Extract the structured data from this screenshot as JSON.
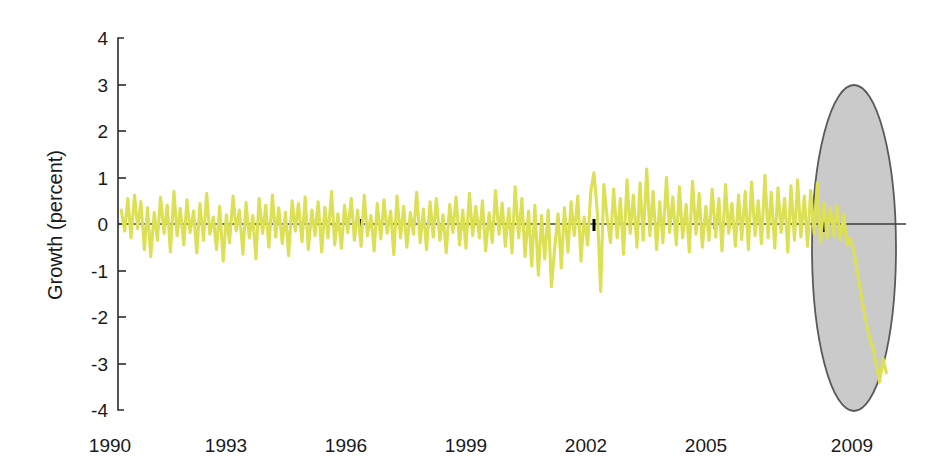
{
  "chart_data": {
    "type": "line",
    "title": "",
    "subtitle": "",
    "xlabel": "",
    "ylabel": "Growth (percent)",
    "xlim": [
      1990.0,
      2010.0
    ],
    "ylim": [
      -4,
      4
    ],
    "grid": false,
    "legend": null,
    "series_color": "#dce055",
    "x_tick_labels": [
      "1990",
      "1993",
      "1996",
      "1999",
      "2002",
      "2005",
      "2009"
    ],
    "x_tick_values": [
      1990,
      1993,
      1996,
      1999,
      2002,
      2005,
      2009
    ],
    "y_tick_labels": [
      "4",
      "3",
      "2",
      "1",
      "0",
      "-1",
      "-2",
      "-3",
      "-4"
    ],
    "y_tick_values": [
      4,
      3,
      2,
      1,
      0,
      -1,
      -2,
      -3,
      -4
    ],
    "annotations": [
      {
        "name": "recession-highlight-ellipse",
        "shape": "ellipse",
        "fill": "#c6c6c6",
        "stroke": "#5a5a5a",
        "center_x": 2008.9,
        "center_y": -0.5,
        "radius_x_years": 1.0,
        "radius_y_percent": 3.5
      }
    ],
    "series": [
      {
        "name": "Growth",
        "color": "#dce055",
        "x": [
          1990.08,
          1990.17,
          1990.25,
          1990.33,
          1990.42,
          1990.5,
          1990.58,
          1990.67,
          1990.75,
          1990.83,
          1990.92,
          1991.0,
          1991.08,
          1991.17,
          1991.25,
          1991.33,
          1991.42,
          1991.5,
          1991.58,
          1991.67,
          1991.75,
          1991.83,
          1991.92,
          1992.0,
          1992.08,
          1992.17,
          1992.25,
          1992.33,
          1992.42,
          1992.5,
          1992.58,
          1992.67,
          1992.75,
          1992.83,
          1992.92,
          1993.0,
          1993.08,
          1993.17,
          1993.25,
          1993.33,
          1993.42,
          1993.5,
          1993.58,
          1993.67,
          1993.75,
          1993.83,
          1993.92,
          1994.0,
          1994.08,
          1994.17,
          1994.25,
          1994.33,
          1994.42,
          1994.5,
          1994.58,
          1994.67,
          1994.75,
          1994.83,
          1994.92,
          1995.0,
          1995.08,
          1995.17,
          1995.25,
          1995.33,
          1995.42,
          1995.5,
          1995.58,
          1995.67,
          1995.75,
          1995.83,
          1995.92,
          1996.0,
          1996.08,
          1996.17,
          1996.25,
          1996.33,
          1996.42,
          1996.5,
          1996.58,
          1996.67,
          1996.75,
          1996.83,
          1996.92,
          1997.0,
          1997.08,
          1997.17,
          1997.25,
          1997.33,
          1997.42,
          1997.5,
          1997.58,
          1997.67,
          1997.75,
          1997.83,
          1997.92,
          1998.0,
          1998.08,
          1998.17,
          1998.25,
          1998.33,
          1998.42,
          1998.5,
          1998.58,
          1998.67,
          1998.75,
          1998.83,
          1998.92,
          1999.0,
          1999.08,
          1999.17,
          1999.25,
          1999.33,
          1999.42,
          1999.5,
          1999.58,
          1999.67,
          1999.75,
          1999.83,
          1999.92,
          2000.0,
          2000.08,
          2000.17,
          2000.25,
          2000.33,
          2000.42,
          2000.5,
          2000.58,
          2000.67,
          2000.75,
          2000.83,
          2000.92,
          2001.0,
          2001.08,
          2001.17,
          2001.25,
          2001.33,
          2001.42,
          2001.5,
          2001.58,
          2001.67,
          2001.75,
          2001.83,
          2001.92,
          2002.0,
          2002.08,
          2002.17,
          2002.25,
          2002.33,
          2002.42,
          2002.5,
          2002.58,
          2002.67,
          2002.75,
          2002.83,
          2002.92,
          2003.0,
          2003.08,
          2003.17,
          2003.25,
          2003.33,
          2003.42,
          2003.5,
          2003.58,
          2003.67,
          2003.75,
          2003.83,
          2003.92,
          2004.0,
          2004.08,
          2004.17,
          2004.25,
          2004.33,
          2004.42,
          2004.5,
          2004.58,
          2004.67,
          2004.75,
          2004.83,
          2004.92,
          2005.0,
          2005.08,
          2005.17,
          2005.25,
          2005.33,
          2005.42,
          2005.5,
          2005.58,
          2005.67,
          2005.75,
          2005.83,
          2005.92,
          2006.0,
          2006.08,
          2006.17,
          2006.25,
          2006.33,
          2006.42,
          2006.5,
          2006.58,
          2006.67,
          2006.75,
          2006.83,
          2006.92,
          2007.0,
          2007.08,
          2007.17,
          2007.25,
          2007.33,
          2007.42,
          2007.5,
          2007.58,
          2007.67,
          2007.75,
          2007.83,
          2007.92,
          2008.0,
          2008.08,
          2008.17,
          2008.25,
          2008.33,
          2008.42,
          2008.5,
          2008.58,
          2008.67,
          2008.75,
          2008.83,
          2008.92,
          2009.0,
          2009.08,
          2009.17,
          2009.25,
          2009.33,
          2009.42,
          2009.5
        ],
        "y": [
          0.3,
          -0.15,
          0.55,
          -0.3,
          0.62,
          -0.1,
          0.48,
          -0.55,
          0.35,
          -0.7,
          0.25,
          -0.35,
          0.58,
          -0.2,
          0.4,
          -0.6,
          0.7,
          -0.25,
          0.33,
          -0.45,
          0.52,
          -0.18,
          0.28,
          -0.62,
          0.44,
          -0.35,
          0.66,
          -0.22,
          0.15,
          -0.55,
          0.38,
          -0.8,
          0.2,
          -0.4,
          0.6,
          -0.15,
          0.3,
          -0.65,
          0.46,
          -0.3,
          0.18,
          -0.75,
          0.55,
          -0.2,
          0.4,
          -0.5,
          0.62,
          -0.28,
          0.35,
          -0.42,
          0.25,
          -0.68,
          0.5,
          -0.15,
          0.44,
          -0.38,
          0.58,
          -0.55,
          0.3,
          -0.25,
          0.48,
          -0.6,
          0.36,
          -0.3,
          0.7,
          -0.45,
          0.22,
          -0.52,
          0.4,
          -0.18,
          0.55,
          -0.35,
          0.3,
          -0.48,
          0.62,
          -0.25,
          0.18,
          -0.58,
          0.44,
          -0.32,
          0.52,
          -0.2,
          0.28,
          -0.66,
          0.6,
          -0.3,
          0.38,
          -0.5,
          0.25,
          -0.22,
          0.68,
          -0.4,
          0.32,
          -0.55,
          0.48,
          -0.28,
          0.55,
          -0.35,
          0.2,
          -0.62,
          0.42,
          -0.18,
          0.58,
          -0.45,
          0.3,
          -0.52,
          0.66,
          -0.25,
          0.38,
          -0.3,
          0.5,
          -0.58,
          0.24,
          -0.4,
          0.72,
          -0.22,
          0.45,
          -0.48,
          0.33,
          -0.62,
          0.8,
          -0.3,
          0.55,
          -0.7,
          0.28,
          -0.9,
          0.4,
          -1.1,
          0.18,
          -0.75,
          0.3,
          -1.35,
          -0.55,
          0.22,
          -0.95,
          0.35,
          -0.6,
          0.48,
          -0.25,
          0.6,
          -0.8,
          0.15,
          -0.45,
          0.7,
          1.1,
          0.2,
          -1.45,
          0.85,
          0.1,
          -0.4,
          0.75,
          -0.3,
          0.55,
          -0.65,
          0.95,
          -0.2,
          0.62,
          -0.5,
          0.88,
          -0.35,
          1.18,
          -0.25,
          0.7,
          -0.55,
          0.48,
          -0.4,
          1.0,
          -0.18,
          0.58,
          -0.45,
          0.8,
          -0.3,
          0.42,
          -0.6,
          0.92,
          -0.22,
          0.66,
          -0.5,
          0.38,
          -0.35,
          0.75,
          -0.28,
          0.55,
          -0.58,
          0.85,
          -0.2,
          0.44,
          -0.48,
          0.62,
          -0.33,
          0.7,
          -0.55,
          0.9,
          -0.25,
          0.5,
          -0.42,
          1.05,
          -0.3,
          0.68,
          -0.52,
          0.78,
          -0.18,
          0.55,
          -0.6,
          0.82,
          -0.35,
          0.95,
          -0.28,
          0.6,
          -0.48,
          0.72,
          -0.22,
          0.88,
          -0.4,
          0.45,
          -0.3,
          0.35,
          -0.25,
          0.4,
          -0.35,
          0.2,
          -0.45,
          -0.3,
          -0.55,
          -0.95,
          -1.35,
          -1.8,
          -2.15,
          -2.45,
          -2.7,
          -3.05,
          -3.4,
          -2.9,
          -3.2
        ]
      }
    ],
    "event_ticks_on_axis": [
      2001.3,
      2002.05,
      2004.9,
      2008.35
    ]
  },
  "figure": {
    "background": "#ffffff",
    "axis_color": "#2b2b2b"
  }
}
